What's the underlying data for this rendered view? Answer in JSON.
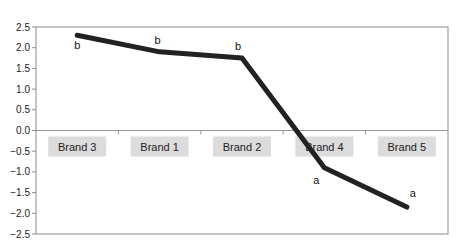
{
  "chart_data": {
    "type": "line",
    "title": "",
    "xlabel": "",
    "ylabel": "",
    "categories": [
      "Brand 3",
      "Brand 1",
      "Brand 2",
      "Brand 4",
      "Brand 5"
    ],
    "series": [
      {
        "name": "Score",
        "values": [
          2.3,
          1.9,
          1.75,
          -0.9,
          -1.85
        ],
        "color": "#222222"
      }
    ],
    "annotations": [
      "b",
      "b",
      "b",
      "a",
      "a"
    ],
    "ylim": [
      -2.5,
      2.5
    ],
    "yticks": [
      2.5,
      2.0,
      1.5,
      1.0,
      0.5,
      0.0,
      -0.5,
      -1.0,
      -1.5,
      -2.0,
      -2.5
    ],
    "ytick_labels": [
      "2.5",
      "2.0",
      "1.5",
      "1.0",
      "0.5",
      "0.0",
      "−0.5",
      "−1.0",
      "−1.5",
      "−2.0",
      "−2.5"
    ],
    "grid": false,
    "legend": "none",
    "category_label_background": "#dcdcdc"
  }
}
